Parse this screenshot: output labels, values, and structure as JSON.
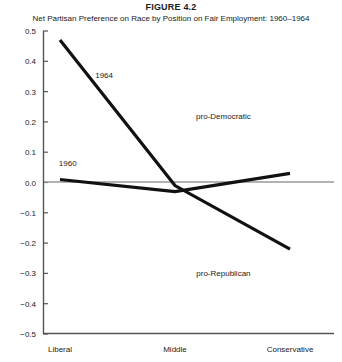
{
  "chart_data": {
    "type": "line",
    "title": "FIGURE 4.2",
    "subtitle": "Net Partisan Preference on Race by Position on Fair Employment: 1960–1964",
    "categories": [
      "Liberal",
      "Middle",
      "Conservative"
    ],
    "series": [
      {
        "name": "1964",
        "values": [
          0.47,
          -0.01,
          -0.22
        ]
      },
      {
        "name": "1960",
        "values": [
          0.01,
          -0.03,
          0.03
        ]
      }
    ],
    "xlabel": "",
    "ylabel": "",
    "ylim": [
      -0.5,
      0.5
    ],
    "ytick_labels": [
      "0.5",
      "0.4",
      "0.3",
      "0.2",
      "0.1",
      "0.0",
      "−0.1",
      "−0.2",
      "−0.3",
      "−0.4",
      "−0.5"
    ],
    "ytick_values": [
      0.5,
      0.4,
      0.3,
      0.2,
      0.1,
      0.0,
      -0.1,
      -0.2,
      -0.3,
      -0.4,
      -0.5
    ],
    "grid": false,
    "zero_line": true,
    "legend_position": "inline",
    "annotations": [
      {
        "text": "pro-Democratic",
        "x": 0.62,
        "y": 0.21
      },
      {
        "text": "pro-Republican",
        "x": 0.62,
        "y": -0.31
      }
    ],
    "series_labels": [
      {
        "text": "1964",
        "x": 0.21,
        "y": 0.345
      },
      {
        "text": "1960",
        "x": 0.085,
        "y": 0.055
      }
    ],
    "colors": {
      "line": "#111111",
      "axis": "#555555",
      "zero_line": "#9a9a9a",
      "background": "#ffffff"
    }
  }
}
